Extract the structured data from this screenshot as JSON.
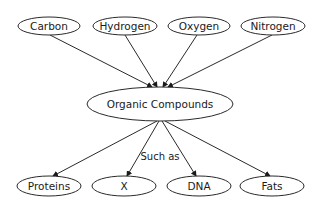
{
  "diagram": {
    "top_nodes": [
      {
        "label": "Carbon",
        "cx": 49,
        "cy": 26,
        "rx": 31,
        "ry": 9
      },
      {
        "label": "Hydrogen",
        "cx": 125,
        "cy": 26,
        "rx": 32,
        "ry": 9
      },
      {
        "label": "Oxygen",
        "cx": 199,
        "cy": 26,
        "rx": 31,
        "ry": 9
      },
      {
        "label": "Nitrogen",
        "cx": 273,
        "cy": 26,
        "rx": 32,
        "ry": 9
      }
    ],
    "center_node": {
      "label": "Organic Compounds",
      "cx": 160,
      "cy": 104,
      "rx": 73,
      "ry": 17
    },
    "bottom_nodes": [
      {
        "label": "Proteins",
        "cx": 49,
        "cy": 186,
        "rx": 32,
        "ry": 10
      },
      {
        "label": "X",
        "cx": 124,
        "cy": 186,
        "rx": 32,
        "ry": 10
      },
      {
        "label": "DNA",
        "cx": 199,
        "cy": 186,
        "rx": 32,
        "ry": 10
      },
      {
        "label": "Fats",
        "cx": 272,
        "cy": 186,
        "rx": 32,
        "ry": 10
      }
    ],
    "edge_label": "Such as"
  }
}
